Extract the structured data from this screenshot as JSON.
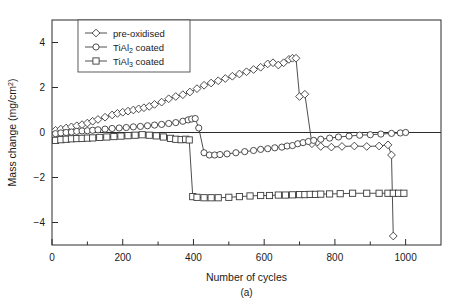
{
  "chart_data": {
    "type": "line",
    "title": "",
    "panel_label": "(a)",
    "xlabel": "Number of cycles",
    "ylabel": "Mass change (mg/cm²)",
    "xlim": [
      0,
      1100
    ],
    "ylim": [
      -5,
      5
    ],
    "xticks": [
      0,
      200,
      400,
      600,
      800,
      1000
    ],
    "xticklabels": [
      "0",
      "200",
      "400",
      "600",
      "800",
      "1000"
    ],
    "xminorticks": [
      100,
      300,
      500,
      700,
      900
    ],
    "yticks": [
      4,
      2,
      0,
      -2,
      -4
    ],
    "yticklabels": [
      "4",
      "2",
      "0",
      "−2",
      "−4"
    ],
    "grid": false,
    "legend_position": "upper left",
    "zero_reference_line": true,
    "series": [
      {
        "name": "pre-oxidised",
        "legend_label": "pre-oxidised",
        "marker": "diamond",
        "x": [
          10,
          25,
          40,
          55,
          70,
          85,
          100,
          115,
          130,
          150,
          170,
          185,
          200,
          215,
          230,
          245,
          260,
          275,
          290,
          310,
          330,
          350,
          370,
          390,
          410,
          430,
          450,
          470,
          490,
          510,
          530,
          550,
          570,
          590,
          610,
          625,
          640,
          655,
          670,
          680,
          690,
          700,
          715,
          735,
          760,
          790,
          820,
          855,
          890,
          925,
          950,
          960,
          965
        ],
        "y": [
          0.1,
          0.15,
          0.2,
          0.25,
          0.3,
          0.35,
          0.42,
          0.5,
          0.58,
          0.68,
          0.78,
          0.85,
          0.9,
          0.95,
          1.0,
          1.05,
          1.1,
          1.16,
          1.25,
          1.35,
          1.5,
          1.6,
          1.68,
          1.8,
          1.95,
          2.1,
          2.2,
          2.3,
          2.4,
          2.5,
          2.6,
          2.7,
          2.8,
          2.9,
          3.05,
          3.1,
          3.0,
          3.1,
          3.25,
          3.3,
          3.3,
          1.6,
          1.7,
          -0.5,
          -0.62,
          -0.65,
          -0.62,
          -0.6,
          -0.62,
          -0.6,
          -0.55,
          -1.0,
          -4.6
        ]
      },
      {
        "name": "TiAl2 coated",
        "legend_label_main": "TiAl",
        "legend_label_sub": "2",
        "legend_label_tail": " coated",
        "marker": "circle",
        "x": [
          10,
          25,
          40,
          55,
          70,
          85,
          100,
          115,
          130,
          150,
          170,
          190,
          210,
          230,
          250,
          270,
          290,
          310,
          330,
          350,
          370,
          385,
          395,
          405,
          415,
          430,
          445,
          460,
          475,
          495,
          520,
          545,
          570,
          590,
          610,
          630,
          650,
          665,
          680,
          695,
          710,
          725,
          740,
          760,
          785,
          810,
          840,
          870,
          900,
          930,
          960,
          985,
          1000
        ],
        "y": [
          -0.05,
          -0.02,
          0.0,
          0.02,
          0.05,
          0.07,
          0.08,
          0.1,
          0.12,
          0.15,
          0.18,
          0.2,
          0.22,
          0.25,
          0.27,
          0.3,
          0.33,
          0.36,
          0.4,
          0.44,
          0.5,
          0.56,
          0.6,
          0.62,
          0.2,
          -0.9,
          -1.0,
          -1.0,
          -0.98,
          -0.95,
          -0.9,
          -0.85,
          -0.8,
          -0.75,
          -0.72,
          -0.68,
          -0.65,
          -0.6,
          -0.58,
          -0.5,
          -0.45,
          -0.4,
          -0.35,
          -0.3,
          -0.25,
          -0.2,
          -0.16,
          -0.12,
          -0.1,
          -0.07,
          -0.04,
          -0.02,
          0.0
        ]
      },
      {
        "name": "TiAl3 coated",
        "legend_label_main": "TiAl",
        "legend_label_sub": "3",
        "legend_label_tail": " coated",
        "marker": "square",
        "x": [
          10,
          25,
          40,
          55,
          70,
          85,
          100,
          115,
          135,
          155,
          175,
          195,
          215,
          235,
          255,
          275,
          295,
          315,
          335,
          350,
          365,
          378,
          388,
          398,
          410,
          430,
          450,
          470,
          500,
          530,
          560,
          590,
          615,
          640,
          660,
          680,
          700,
          715,
          730,
          745,
          760,
          785,
          815,
          850,
          890,
          925,
          950,
          965,
          980,
          995
        ],
        "y": [
          -0.35,
          -0.32,
          -0.3,
          -0.28,
          -0.27,
          -0.26,
          -0.25,
          -0.24,
          -0.22,
          -0.2,
          -0.18,
          -0.16,
          -0.14,
          -0.12,
          -0.1,
          -0.12,
          -0.15,
          -0.2,
          -0.26,
          -0.3,
          -0.32,
          -0.3,
          -0.33,
          -2.85,
          -2.88,
          -2.9,
          -2.9,
          -2.9,
          -2.88,
          -2.85,
          -2.82,
          -2.8,
          -2.8,
          -2.78,
          -2.78,
          -2.77,
          -2.76,
          -2.76,
          -2.75,
          -2.75,
          -2.74,
          -2.73,
          -2.72,
          -2.7,
          -2.7,
          -2.7,
          -2.7,
          -2.7,
          -2.7,
          -2.7
        ]
      }
    ]
  }
}
